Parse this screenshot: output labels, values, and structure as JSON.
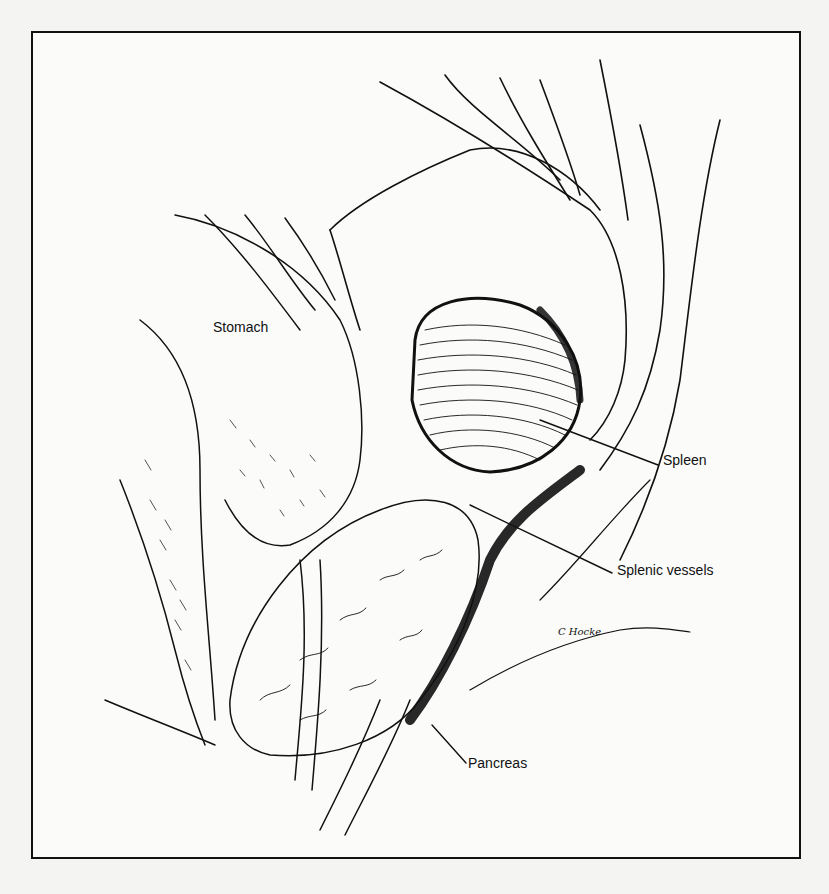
{
  "figure": {
    "type": "surgical illustration",
    "style": "black ink line drawing",
    "colors": {
      "ink": "#111111",
      "paper": "#fbfbfa",
      "background": "#f4f4f3"
    },
    "labels": [
      {
        "id": "stomach",
        "text": "Stomach",
        "x": 213,
        "y": 327
      },
      {
        "id": "spleen",
        "text": "Spleen",
        "x": 663,
        "y": 460
      },
      {
        "id": "splenic-vessels",
        "text": "Splenic vessels",
        "x": 617,
        "y": 570
      },
      {
        "id": "pancreas",
        "text": "Pancreas",
        "x": 468,
        "y": 763
      }
    ],
    "signature": {
      "text": "C Hocke",
      "x": 558,
      "y": 632
    }
  }
}
